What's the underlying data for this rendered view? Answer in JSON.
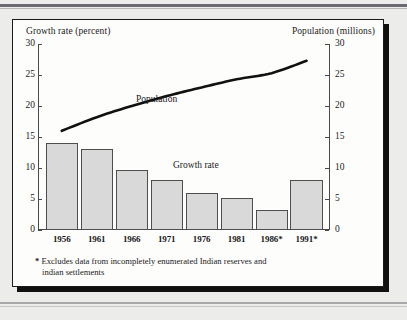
{
  "figure": {
    "background_color": "#ececeb",
    "card_color": "#fdfdfc",
    "bar_fill": "#d9d9d9",
    "bar_stroke": "#4e4e4e",
    "line_color": "#111111"
  },
  "labels": {
    "left_axis_title": "Growth rate (percent)",
    "right_axis_title": "Population (millions)",
    "population_series_label": "Population",
    "growth_series_label": "Growth rate"
  },
  "footnote": {
    "marker": "*",
    "line1": "Excludes data from incompletely enumerated Indian reserves and",
    "line2": "indian settlements"
  },
  "chart_data": {
    "type": "bar",
    "title": "",
    "subtitle": "",
    "xlabel": "",
    "ylabel": "Growth rate (percent)",
    "y2label": "Population (millions)",
    "categories": [
      "1956",
      "1961",
      "1966",
      "1971",
      "1976",
      "1981",
      "1986*",
      "1991*"
    ],
    "ylim": [
      0,
      30
    ],
    "y2lim": [
      0,
      30
    ],
    "yticks": [
      0,
      5,
      10,
      15,
      20,
      25,
      30
    ],
    "y2ticks": [
      0,
      5,
      10,
      15,
      20,
      25,
      30
    ],
    "grid": false,
    "legend_position": "inline-annotations",
    "series": [
      {
        "name": "Growth rate",
        "type": "bar",
        "axis": "left",
        "unit": "percent",
        "values": [
          14.0,
          13.0,
          9.7,
          8.0,
          6.0,
          5.2,
          3.3,
          8.0
        ]
      },
      {
        "name": "Population",
        "type": "line",
        "axis": "right",
        "unit": "millions",
        "values": [
          16.0,
          18.2,
          20.0,
          21.6,
          23.0,
          24.3,
          25.3,
          27.3
        ]
      }
    ],
    "annotations": [
      {
        "text": "Population",
        "x": "1966",
        "y": 24.0
      },
      {
        "text": "Growth rate",
        "x": "1976",
        "y": 12.5
      }
    ]
  }
}
